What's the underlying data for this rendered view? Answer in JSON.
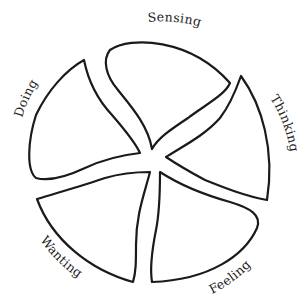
{
  "diagram": {
    "type": "five-petal cycle diagram",
    "background_color": "#ffffff",
    "stroke_color": "#1a1a1a",
    "petals": [
      {
        "id": "sensing",
        "label": "Sensing",
        "position": "top"
      },
      {
        "id": "thinking",
        "label": "Thinking",
        "position": "right"
      },
      {
        "id": "feeling",
        "label": "Feeling",
        "position": "bottom-right"
      },
      {
        "id": "wanting",
        "label": "Wanting",
        "position": "bottom-left"
      },
      {
        "id": "doing",
        "label": "Doing",
        "position": "left"
      }
    ]
  }
}
